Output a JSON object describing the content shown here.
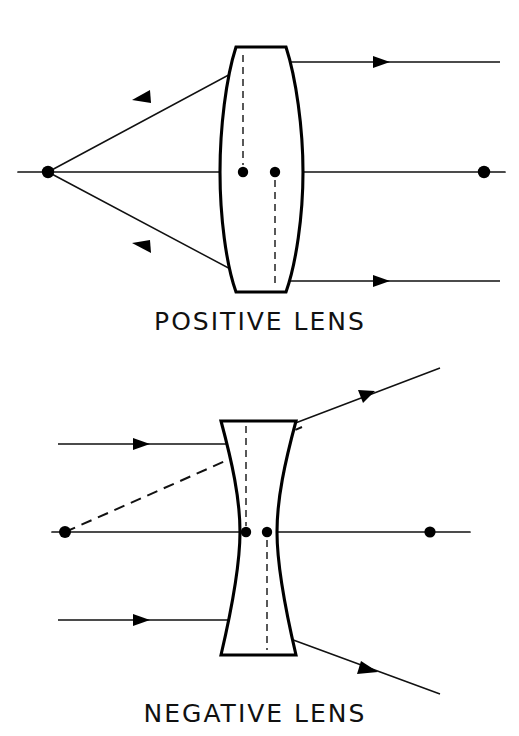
{
  "figure": {
    "background_color": "#ffffff",
    "ink_color": "#111111",
    "width": 519,
    "height": 736
  },
  "panels": [
    {
      "id": "positive",
      "caption": "POSITIVE LENS",
      "caption_x": 260,
      "caption_y": 330,
      "lens_type": "biconvex",
      "axis": {
        "y": 172,
        "x_start": 18,
        "x_end": 505
      },
      "focal_point_left": {
        "x": 48,
        "y": 172
      },
      "focal_point_right": {
        "x": 484,
        "y": 172
      },
      "principal_points": [
        {
          "x": 243,
          "y": 172
        },
        {
          "x": 275,
          "y": 172
        }
      ],
      "principal_planes_dashed": [
        {
          "x": 243,
          "y_top": 55,
          "y_bottom": 165
        },
        {
          "x": 275,
          "y_top": 180,
          "y_bottom": 285
        }
      ],
      "lens_edges": {
        "top_flat_left_x": 236,
        "top_flat_right_x": 286,
        "top_y": 47,
        "bottom_flat_left_x": 236,
        "bottom_flat_right_x": 286,
        "bottom_y": 292,
        "left_vertex_x": 220,
        "right_vertex_x": 303,
        "center_y": 172
      },
      "rays": [
        {
          "name": "upper-marginal-ray",
          "direction": "right-to-left",
          "entry_y": 62,
          "exit_to_focus": true,
          "arrow_positions": [
            {
              "x": 383,
              "y": 62
            },
            {
              "x": 140,
              "y": 96
            }
          ]
        },
        {
          "name": "axial-ray",
          "direction": "right-to-left",
          "entry_y": 172,
          "exit_to_focus": true,
          "arrow_positions": []
        },
        {
          "name": "lower-marginal-ray",
          "direction": "right-to-left",
          "entry_y": 281,
          "exit_to_focus": true,
          "arrow_positions": [
            {
              "x": 383,
              "y": 281
            },
            {
              "x": 140,
              "y": 247
            }
          ]
        }
      ]
    },
    {
      "id": "negative",
      "caption": "NEGATIVE LENS",
      "caption_x": 255,
      "caption_y": 722,
      "lens_type": "biconcave",
      "axis": {
        "y": 532,
        "x_start": 52,
        "x_end": 470
      },
      "virtual_focal_point_left": {
        "x": 65,
        "y": 532
      },
      "focal_point_right": {
        "x": 430,
        "y": 532
      },
      "principal_points": [
        {
          "x": 246,
          "y": 532
        },
        {
          "x": 267,
          "y": 532
        }
      ],
      "principal_planes_dashed": [
        {
          "x": 246,
          "y_top": 420,
          "y_bottom": 525
        },
        {
          "x": 267,
          "y_top": 540,
          "y_bottom": 645
        }
      ],
      "lens_edges": {
        "top_flat_left_x": 221,
        "top_flat_right_x": 296,
        "top_y": 421,
        "bottom_flat_left_x": 221,
        "bottom_flat_right_x": 296,
        "bottom_y": 655,
        "waist_left_x": 240,
        "waist_right_x": 277,
        "center_y": 532
      },
      "rays": [
        {
          "name": "upper-incoming-ray",
          "direction": "left-to-right",
          "entry_y": 444,
          "diverges": true,
          "arrow_positions": [
            {
              "x": 142,
              "y": 444
            },
            {
              "x": 365,
              "y": 393
            }
          ]
        },
        {
          "name": "axial-ray",
          "direction": "left-to-right",
          "entry_y": 532,
          "diverges": false,
          "arrow_positions": []
        },
        {
          "name": "lower-incoming-ray",
          "direction": "left-to-right",
          "entry_y": 620,
          "diverges": true,
          "arrow_positions": [
            {
              "x": 142,
              "y": 620
            },
            {
              "x": 370,
              "y": 668
            }
          ]
        }
      ],
      "virtual_ray": {
        "name": "virtual-back-trace",
        "style": "dashed",
        "from": {
          "x": 65,
          "y": 532
        },
        "to": {
          "x": 300,
          "y": 428
        }
      }
    }
  ]
}
